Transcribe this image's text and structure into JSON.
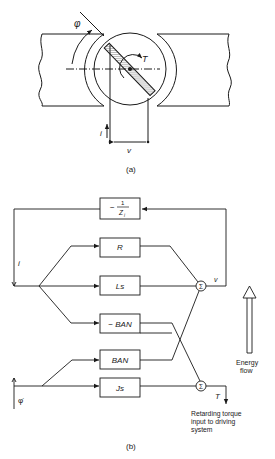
{
  "figure_a": {
    "caption": "(a)",
    "labels": {
      "angle": "φ",
      "torque": "T",
      "current": "i",
      "voltage": "v"
    }
  },
  "figure_b": {
    "caption": "(b)",
    "blocks": {
      "feedback": {
        "sign": "−",
        "num": "1",
        "den": "Z",
        "den_sub": "i"
      },
      "r": "R",
      "ls": "Ls",
      "neg_ban": "− BAN",
      "ban": "BAN",
      "js": "Js"
    },
    "sum_symbol": "Σ",
    "signals": {
      "current": "i",
      "voltage": "v",
      "angular_velocity": "φ̇",
      "torque": "T"
    },
    "energy_flow": {
      "line1": "Energy",
      "line2": "flow"
    },
    "output_note": {
      "line1": "Retarding torque",
      "line2": "input to driving",
      "line3": "system"
    }
  },
  "colors": {
    "ink": "#1a1a1a",
    "paper": "#ffffff",
    "hatch": "#888888"
  }
}
